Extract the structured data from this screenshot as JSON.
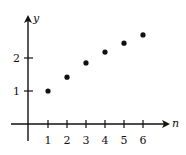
{
  "chart_data": {
    "type": "scatter",
    "title": "",
    "xlabel": "n",
    "ylabel": "y",
    "x": [
      1,
      2,
      3,
      4,
      5,
      6
    ],
    "series": [
      {
        "name": "points",
        "values": [
          1.0,
          1.42,
          1.85,
          2.18,
          2.45,
          2.7
        ]
      }
    ],
    "x_ticks": [
      "1",
      "2",
      "3",
      "4",
      "5",
      "6"
    ],
    "y_ticks": [
      "1",
      "2"
    ],
    "xlim": [
      -1,
      7
    ],
    "ylim": [
      0,
      3
    ],
    "grid": false,
    "legend": "none"
  },
  "colors": {
    "ink": "#111111",
    "background": "#ffffff"
  }
}
